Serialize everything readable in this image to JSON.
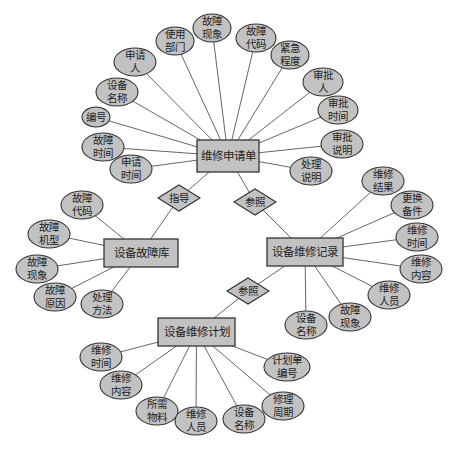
{
  "colors": {
    "fill": "#c2c2c2",
    "stroke": "#333333",
    "line": "#555555",
    "background": "#ffffff"
  },
  "entities": [
    {
      "id": "repair_request",
      "label": "维修申请单",
      "x": 197,
      "y": 140,
      "w": 62,
      "h": 32
    },
    {
      "id": "fault_db",
      "label": "设备故障库",
      "x": 104,
      "y": 239,
      "w": 74,
      "h": 28
    },
    {
      "id": "repair_record",
      "label": "设备维修记录",
      "x": 267,
      "y": 238,
      "w": 76,
      "h": 28
    },
    {
      "id": "repair_plan",
      "label": "设备维修计划",
      "x": 158,
      "y": 318,
      "w": 77,
      "h": 28
    }
  ],
  "relationships": [
    {
      "id": "guide",
      "label": "指导",
      "cx": 179,
      "cy": 198,
      "w": 42,
      "h": 26,
      "from": "repair_request",
      "to": "fault_db"
    },
    {
      "id": "ref1",
      "label": "参照",
      "cx": 255,
      "cy": 202,
      "w": 42,
      "h": 26,
      "from": "repair_request",
      "to": "repair_record"
    },
    {
      "id": "ref2",
      "label": "参照",
      "cx": 248,
      "cy": 291,
      "w": 42,
      "h": 26,
      "from": "repair_record",
      "to": "repair_plan"
    }
  ],
  "attributes": [
    {
      "entity": "repair_request",
      "label": "编号",
      "cx": 96,
      "cy": 117,
      "rx": 14,
      "ry": 10
    },
    {
      "entity": "repair_request",
      "label": "故障\n时间",
      "cx": 103,
      "cy": 147,
      "rx": 21,
      "ry": 14
    },
    {
      "entity": "repair_request",
      "label": "申请\n时间",
      "cx": 131,
      "cy": 169,
      "rx": 21,
      "ry": 14
    },
    {
      "entity": "repair_request",
      "label": "设备\n名称",
      "cx": 117,
      "cy": 92,
      "rx": 21,
      "ry": 14
    },
    {
      "entity": "repair_request",
      "label": "申请\n人",
      "cx": 135,
      "cy": 62,
      "rx": 21,
      "ry": 14
    },
    {
      "entity": "repair_request",
      "label": "使用\n部门",
      "cx": 175,
      "cy": 41,
      "rx": 19,
      "ry": 14
    },
    {
      "entity": "repair_request",
      "label": "故障\n现象",
      "cx": 212,
      "cy": 28,
      "rx": 19,
      "ry": 14
    },
    {
      "entity": "repair_request",
      "label": "故障\n代码",
      "cx": 256,
      "cy": 38,
      "rx": 20,
      "ry": 14
    },
    {
      "entity": "repair_request",
      "label": "紧急\n程度",
      "cx": 290,
      "cy": 55,
      "rx": 19,
      "ry": 14
    },
    {
      "entity": "repair_request",
      "label": "审批\n人",
      "cx": 323,
      "cy": 82,
      "rx": 20,
      "ry": 14
    },
    {
      "entity": "repair_request",
      "label": "审批\n时间",
      "cx": 338,
      "cy": 110,
      "rx": 20,
      "ry": 14
    },
    {
      "entity": "repair_request",
      "label": "审批\n说明",
      "cx": 342,
      "cy": 144,
      "rx": 21,
      "ry": 14
    },
    {
      "entity": "repair_request",
      "label": "处理\n说明",
      "cx": 311,
      "cy": 171,
      "rx": 21,
      "ry": 14
    },
    {
      "entity": "fault_db",
      "label": "故障\n代码",
      "cx": 82,
      "cy": 205,
      "rx": 21,
      "ry": 14
    },
    {
      "entity": "fault_db",
      "label": "故障\n机型",
      "cx": 49,
      "cy": 234,
      "rx": 21,
      "ry": 14
    },
    {
      "entity": "fault_db",
      "label": "故障\n现象",
      "cx": 37,
      "cy": 269,
      "rx": 21,
      "ry": 14
    },
    {
      "entity": "fault_db",
      "label": "故障\n原因",
      "cx": 55,
      "cy": 297,
      "rx": 21,
      "ry": 14
    },
    {
      "entity": "fault_db",
      "label": "处理\n方法",
      "cx": 102,
      "cy": 304,
      "rx": 21,
      "ry": 14
    },
    {
      "entity": "repair_record",
      "label": "维修\n结果",
      "cx": 383,
      "cy": 181,
      "rx": 21,
      "ry": 14
    },
    {
      "entity": "repair_record",
      "label": "更换\n备件",
      "cx": 412,
      "cy": 205,
      "rx": 21,
      "ry": 14
    },
    {
      "entity": "repair_record",
      "label": "维修\n时间",
      "cx": 417,
      "cy": 237,
      "rx": 21,
      "ry": 14
    },
    {
      "entity": "repair_record",
      "label": "维修\n内容",
      "cx": 421,
      "cy": 269,
      "rx": 21,
      "ry": 14
    },
    {
      "entity": "repair_record",
      "label": "维修\n人员",
      "cx": 389,
      "cy": 295,
      "rx": 21,
      "ry": 14
    },
    {
      "entity": "repair_record",
      "label": "故障\n现象",
      "cx": 350,
      "cy": 317,
      "rx": 21,
      "ry": 14
    },
    {
      "entity": "repair_record",
      "label": "设备\n名称",
      "cx": 306,
      "cy": 325,
      "rx": 21,
      "ry": 14
    },
    {
      "entity": "repair_plan",
      "label": "维修\n时间",
      "cx": 101,
      "cy": 357,
      "rx": 21,
      "ry": 14
    },
    {
      "entity": "repair_plan",
      "label": "维修\n内容",
      "cx": 121,
      "cy": 385,
      "rx": 21,
      "ry": 14
    },
    {
      "entity": "repair_plan",
      "label": "所需\n物料",
      "cx": 157,
      "cy": 411,
      "rx": 21,
      "ry": 14
    },
    {
      "entity": "repair_plan",
      "label": "维修\n人员",
      "cx": 196,
      "cy": 421,
      "rx": 21,
      "ry": 14
    },
    {
      "entity": "repair_plan",
      "label": "设备\n名称",
      "cx": 244,
      "cy": 419,
      "rx": 21,
      "ry": 14
    },
    {
      "entity": "repair_plan",
      "label": "修理\n周期",
      "cx": 283,
      "cy": 406,
      "rx": 21,
      "ry": 14
    },
    {
      "entity": "repair_plan",
      "label": "计划单\n编号",
      "cx": 287,
      "cy": 367,
      "rx": 23,
      "ry": 14
    }
  ]
}
